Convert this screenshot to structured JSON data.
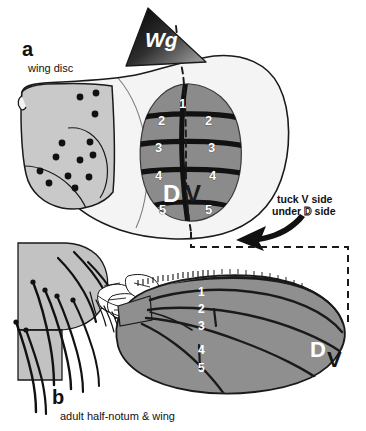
{
  "figure": {
    "width": 366,
    "height": 431,
    "background": "#ffffff"
  },
  "panel_a": {
    "letter": "a",
    "caption": "wing disc",
    "wg_label": "Wg",
    "pouch": {
      "d_label": "D",
      "v_label": "V",
      "stripe_numbers_center": [
        "1"
      ],
      "stripe_numbers_left": [
        "2",
        "3",
        "4",
        "5"
      ],
      "stripe_numbers_right": [
        "2",
        "3",
        "4",
        "5"
      ]
    },
    "notum_sensory_dot_count": 13
  },
  "panel_b": {
    "letter": "b",
    "caption": "adult half-notum & wing",
    "vein_numbers": [
      "1",
      "2",
      "3",
      "4",
      "5"
    ],
    "d_label": "D",
    "v_label": "V"
  },
  "instruction": {
    "line1": "tuck V side",
    "line2_prefix": "under ",
    "line2_letter": "D",
    "line2_suffix": " side"
  },
  "colors": {
    "outline": "#1a1a1a",
    "notum_fill": "#c9c9c9",
    "pouch_fill": "#8b8b8b",
    "disc_body_fill": "#f2f2f2",
    "wing_fill": "#8f8f8f",
    "wing_fill_lower": "#909090",
    "notum_b_fill": "#c2c2c2",
    "stripe_black": "#111111",
    "white": "#ffffff",
    "wg_dark": "#111111",
    "wg_light": "#9a9a9a"
  }
}
